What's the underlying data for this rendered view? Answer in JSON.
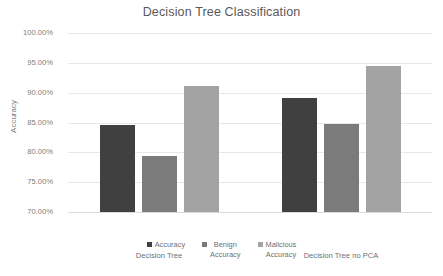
{
  "chart_data": {
    "type": "bar",
    "title": "Decision Tree Classification",
    "xlabel": "",
    "ylabel": "Accuracy",
    "categories": [
      "Decision Tree",
      "Decision Tree no PCA"
    ],
    "series": [
      {
        "name": "Accuracy",
        "values": [
          84.6,
          89.1
        ],
        "color": "#404040"
      },
      {
        "name": "Benign Accuracy",
        "values": [
          79.4,
          84.8
        ],
        "color": "#7b7b7b"
      },
      {
        "name": "Malicious Accuracy",
        "values": [
          91.1,
          94.4
        ],
        "color": "#a3a3a3"
      }
    ],
    "ylim": [
      70,
      100
    ],
    "ytick_labels": [
      "100.00%",
      "95.00%",
      "90.00%",
      "85.00%",
      "80.00%",
      "75.00%",
      "70.00%"
    ],
    "ytick_values": [
      100,
      95,
      90,
      85,
      80,
      75,
      70
    ],
    "grid": true,
    "legend_position": "bottom",
    "legend_entries": [
      "Accuracy",
      "Benign\nAccuracy",
      "Malicious\nAccuracy"
    ]
  }
}
